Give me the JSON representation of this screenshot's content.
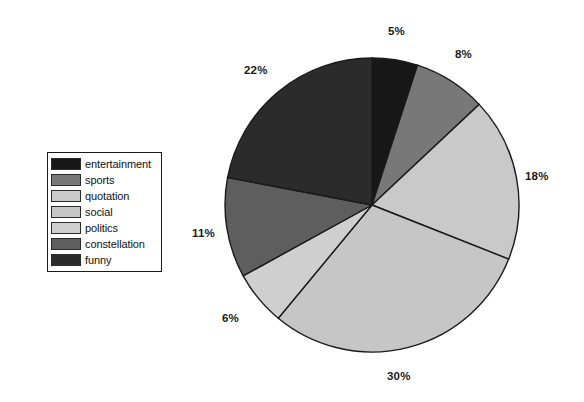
{
  "chart_data": {
    "type": "pie",
    "title": "",
    "subtitle": "",
    "xlabel": "",
    "ylabel": "",
    "grid": false,
    "legend_position": "left",
    "start_angle_deg": 0,
    "direction": "clockwise",
    "categories": [
      "entertainment",
      "sports",
      "quotation",
      "social",
      "politics",
      "constellation",
      "funny"
    ],
    "values": [
      5,
      8,
      18,
      30,
      6,
      11,
      22
    ],
    "value_unit": "%",
    "data_labels": [
      "5%",
      "8%",
      "18%",
      "30%",
      "6%",
      "11%",
      "22%"
    ],
    "colors": [
      "#171717",
      "#787878",
      "#c9c9c9",
      "#c6c6c6",
      "#cfcfcf",
      "#5e5e5e",
      "#2b2b2b"
    ],
    "slices": [
      {
        "label": "entertainment",
        "value": 5,
        "data_label": "5%",
        "color": "#171717"
      },
      {
        "label": "sports",
        "value": 8,
        "data_label": "8%",
        "color": "#787878"
      },
      {
        "label": "quotation",
        "value": 18,
        "data_label": "18%",
        "color": "#c9c9c9"
      },
      {
        "label": "social",
        "value": 30,
        "data_label": "30%",
        "color": "#c6c6c6"
      },
      {
        "label": "politics",
        "value": 6,
        "data_label": "6%",
        "color": "#cfcfcf"
      },
      {
        "label": "constellation",
        "value": 11,
        "data_label": "11%",
        "color": "#5e5e5e"
      },
      {
        "label": "funny",
        "value": 22,
        "data_label": "22%",
        "color": "#2b2b2b"
      }
    ]
  },
  "legend": {
    "items": [
      {
        "label": "entertainment",
        "color": "#171717"
      },
      {
        "label": "sports",
        "color": "#787878"
      },
      {
        "label": "quotation",
        "color": "#c9c9c9"
      },
      {
        "label": "social",
        "color": "#c6c6c6"
      },
      {
        "label": "politics",
        "color": "#cfcfcf"
      },
      {
        "label": "constellation",
        "color": "#5e5e5e"
      },
      {
        "label": "funny",
        "color": "#2b2b2b"
      }
    ]
  },
  "pie": {
    "center_x": 372,
    "center_y": 205,
    "radius": 147,
    "outline_color": "#1a1a1a"
  },
  "labels": [
    {
      "text": "5%",
      "x": 388,
      "y": 25
    },
    {
      "text": "8%",
      "x": 455,
      "y": 48
    },
    {
      "text": "18%",
      "x": 525,
      "y": 170
    },
    {
      "text": "30%",
      "x": 387,
      "y": 370
    },
    {
      "text": "6%",
      "x": 222,
      "y": 312
    },
    {
      "text": "11%",
      "x": 192,
      "y": 227
    },
    {
      "text": "22%",
      "x": 244,
      "y": 64
    }
  ]
}
